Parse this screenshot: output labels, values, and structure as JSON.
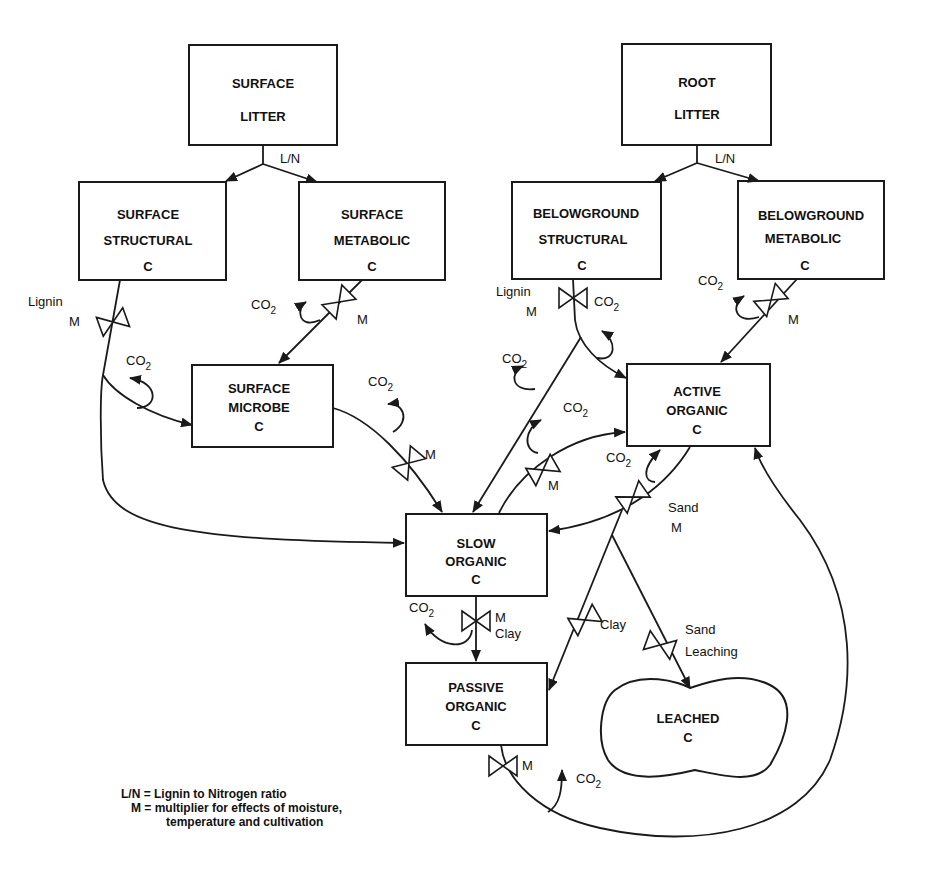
{
  "pools": {
    "surface_litter": [
      "SURFACE",
      "LITTER"
    ],
    "root_litter": [
      "ROOT",
      "LITTER"
    ],
    "surface_structural": [
      "SURFACE",
      "STRUCTURAL",
      "C"
    ],
    "surface_metabolic": [
      "SURFACE",
      "METABOLIC",
      "C"
    ],
    "belowground_structural": [
      "BELOWGROUND",
      "STRUCTURAL",
      "C"
    ],
    "belowground_metabolic": [
      "BELOWGROUND",
      "METABOLIC",
      "C"
    ],
    "surface_microbe": [
      "SURFACE",
      "MICROBE",
      "C"
    ],
    "active_organic": [
      "ACTIVE",
      "ORGANIC",
      "C"
    ],
    "slow_organic": [
      "SLOW",
      "ORGANIC",
      "C"
    ],
    "passive_organic": [
      "PASSIVE",
      "ORGANIC",
      "C"
    ],
    "leached": [
      "LEACHED",
      "C"
    ]
  },
  "labels": {
    "ln": "L/N",
    "lignin": "Lignin",
    "m": "M",
    "co2_main": "CO",
    "co2_sub": "2",
    "sand": "Sand",
    "clay": "Clay",
    "leaching": "Leaching"
  },
  "legend": {
    "line1": "L/N = Lignin to Nitrogen ratio",
    "line2": "M = multiplier for effects of moisture,",
    "line3": "temperature and cultivation"
  }
}
